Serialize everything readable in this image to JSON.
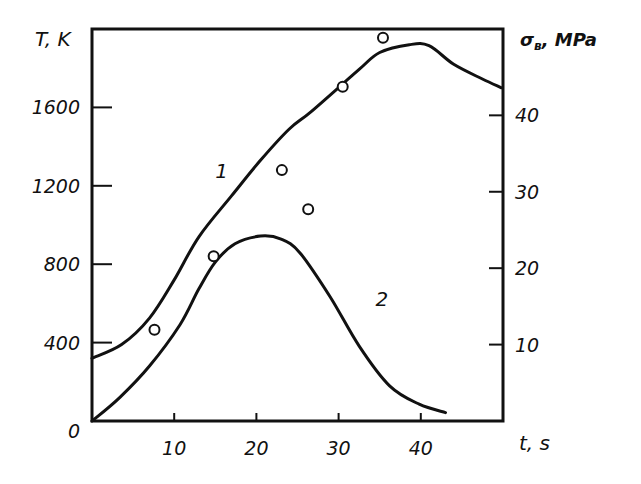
{
  "chart_data": {
    "type": "line",
    "title": "",
    "xlabel": "t, s",
    "ylabel_left": "T, K",
    "ylabel_right": "σв, MPa",
    "xlim": [
      0,
      50
    ],
    "ylim_left": [
      0,
      2000
    ],
    "ylim_right": [
      0,
      51.3
    ],
    "grid": false,
    "legend": "none (curves labeled inline '1' and '2')",
    "x_ticks": [
      10,
      20,
      30,
      40
    ],
    "x_tick_labels": [
      "10",
      "20",
      "30",
      "40"
    ],
    "left_ticks": [
      0,
      400,
      800,
      1200,
      1600
    ],
    "left_tick_labels": [
      "0",
      "400",
      "800",
      "1200",
      "1600"
    ],
    "right_ticks": [
      10,
      20,
      30,
      40
    ],
    "right_tick_labels": [
      "10",
      "20",
      "30",
      "40"
    ],
    "series": [
      {
        "name": "1",
        "axis": "left",
        "description": "Temperature T (K) vs time",
        "kind": "line",
        "x": [
          0,
          3.6,
          7,
          10,
          13,
          17,
          20.5,
          24,
          26.7,
          32.4,
          35,
          38.6,
          41,
          44,
          47.5,
          49.8
        ],
        "y": [
          320,
          390,
          525,
          720,
          940,
          1150,
          1330,
          1490,
          1580,
          1790,
          1880,
          1920,
          1915,
          1820,
          1745,
          1700
        ],
        "label_position": {
          "x": 15,
          "y": 1240
        }
      },
      {
        "name": "2",
        "axis": "right",
        "description": "Ultimate strength σв (MPa) vs time",
        "kind": "line",
        "x": [
          0,
          3.4,
          7,
          10.7,
          13,
          15,
          17.4,
          20.5,
          23,
          25.3,
          29,
          32.5,
          36.2,
          39.8,
          43
        ],
        "y": [
          0,
          3.1,
          7.2,
          12.6,
          17.3,
          20.8,
          23.2,
          24.2,
          23.8,
          22.0,
          16.2,
          9.8,
          4.6,
          2.2,
          1.1
        ],
        "label_position": {
          "x": 34.5,
          "y": 15
        }
      },
      {
        "name": "experimental points",
        "axis": "left",
        "kind": "scatter",
        "marker": "open circle",
        "x": [
          7.6,
          14.8,
          23.1,
          26.3,
          30.5,
          35.4
        ],
        "y": [
          465,
          840,
          1280,
          1080,
          1705,
          1955
        ]
      }
    ]
  },
  "labels": {
    "left_axis_title": "T, K",
    "right_axis_title_sigma": "σ",
    "right_axis_title_sub": "в",
    "right_axis_title_rest": ", MPa",
    "x_axis_title": "t, s",
    "curve1": "1",
    "curve2": "2"
  }
}
